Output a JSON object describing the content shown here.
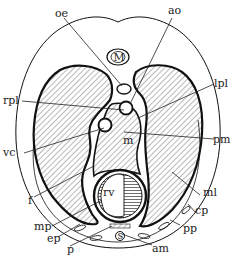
{
  "figure": {
    "colors": {
      "ink": "#111111",
      "background": "#ffffff"
    },
    "labels": {
      "oe": "oe",
      "ao": "ao",
      "rpl": "rpl",
      "lpl": "lpl",
      "m": "m",
      "pm": "pm",
      "vc": "vc",
      "f": "f",
      "ml": "ml",
      "rv": "rv",
      "cp": "cp",
      "mp": "mp",
      "ep": "ep",
      "pp": "pp",
      "p": "p",
      "am": "am",
      "s": "s",
      "vertebra": "M"
    }
  }
}
